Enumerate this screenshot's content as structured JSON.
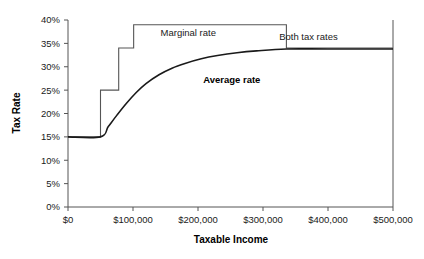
{
  "chart_data": {
    "type": "line",
    "title": "",
    "xlabel": "Taxable Income",
    "ylabel": "Tax Rate",
    "xlim": [
      0,
      500000
    ],
    "ylim": [
      0,
      0.4
    ],
    "grid": false,
    "legend_position": "inline-annotations",
    "xticks": [
      0,
      100000,
      200000,
      300000,
      400000,
      500000
    ],
    "xticklabels": [
      "$0",
      "$100,000",
      "$200,000",
      "$300,000",
      "$400,000",
      "$500,000"
    ],
    "yticks": [
      0,
      0.05,
      0.1,
      0.15,
      0.2,
      0.25,
      0.3,
      0.35,
      0.4
    ],
    "yticklabels": [
      "0%",
      "5%",
      "10%",
      "15%",
      "20%",
      "25%",
      "30%",
      "35%",
      "40%"
    ],
    "annotations": [
      {
        "text": "Marginal rate",
        "x": 185000,
        "y": 0.365,
        "bold": false
      },
      {
        "text": "Average rate",
        "x": 252000,
        "y": 0.265,
        "bold": true
      },
      {
        "text": "Both tax rates",
        "x": 415000,
        "y": 0.358,
        "bold": false
      }
    ],
    "series": [
      {
        "name": "Marginal rate",
        "style": "step",
        "color": "#555555",
        "points": [
          {
            "x": 0,
            "y": 0.15
          },
          {
            "x": 50000,
            "y": 0.15
          },
          {
            "x": 50000,
            "y": 0.25
          },
          {
            "x": 78000,
            "y": 0.25
          },
          {
            "x": 78000,
            "y": 0.34
          },
          {
            "x": 101000,
            "y": 0.34
          },
          {
            "x": 101000,
            "y": 0.39
          },
          {
            "x": 336000,
            "y": 0.39
          },
          {
            "x": 336000,
            "y": 0.34
          },
          {
            "x": 500000,
            "y": 0.34
          }
        ]
      },
      {
        "name": "Average rate",
        "style": "curve",
        "color": "#1a1a1a",
        "points": [
          {
            "x": 0,
            "y": 0.15
          },
          {
            "x": 50000,
            "y": 0.15
          },
          {
            "x": 62000,
            "y": 0.172
          },
          {
            "x": 75000,
            "y": 0.196
          },
          {
            "x": 90000,
            "y": 0.222
          },
          {
            "x": 105000,
            "y": 0.245
          },
          {
            "x": 120000,
            "y": 0.264
          },
          {
            "x": 140000,
            "y": 0.283
          },
          {
            "x": 160000,
            "y": 0.297
          },
          {
            "x": 180000,
            "y": 0.307
          },
          {
            "x": 205000,
            "y": 0.317
          },
          {
            "x": 230000,
            "y": 0.324
          },
          {
            "x": 260000,
            "y": 0.33
          },
          {
            "x": 290000,
            "y": 0.334
          },
          {
            "x": 336000,
            "y": 0.338
          },
          {
            "x": 400000,
            "y": 0.338
          },
          {
            "x": 500000,
            "y": 0.338
          }
        ]
      }
    ]
  },
  "axis": {
    "ylabel": "Tax Rate",
    "xlabel": "Taxable Income"
  }
}
